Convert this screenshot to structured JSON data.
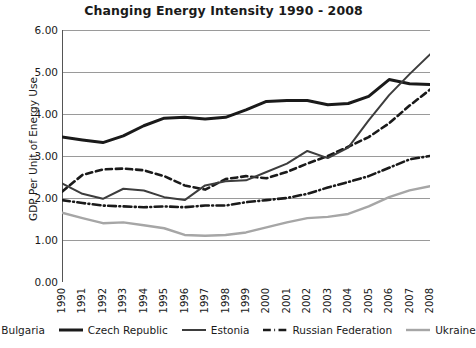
{
  "chart_data": {
    "type": "line",
    "title": "Changing Energy Intensity 1990 - 2008",
    "xlabel": "",
    "ylabel": "GDP Per Unit of Energy Use",
    "ylim": [
      0,
      6
    ],
    "ytick_labels": [
      "6.00",
      "5.00",
      "4.00",
      "3.00",
      "2.00",
      "1.00",
      "0.00"
    ],
    "ytick_values": [
      6,
      5,
      4,
      3,
      2,
      1,
      0
    ],
    "grid": true,
    "legend_position": "bottom",
    "categories": [
      "1990",
      "1991",
      "1992",
      "1993",
      "1994",
      "1995",
      "1996",
      "1997",
      "1998",
      "1999",
      "2000",
      "2001",
      "2002",
      "2003",
      "2004",
      "2005",
      "2006",
      "2007",
      "2008"
    ],
    "x": [
      1990,
      1991,
      1992,
      1993,
      1994,
      1995,
      1996,
      1997,
      1998,
      1999,
      2000,
      2001,
      2002,
      2003,
      2004,
      2005,
      2006,
      2007,
      2008
    ],
    "series": [
      {
        "name": "Bulgaria",
        "color": "#1a1a1a",
        "style": "dashed",
        "width": 2.6,
        "values": [
          2.15,
          2.55,
          2.68,
          2.7,
          2.66,
          2.52,
          2.3,
          2.2,
          2.45,
          2.52,
          2.47,
          2.62,
          2.82,
          3.0,
          3.22,
          3.45,
          3.78,
          4.2,
          4.58
        ]
      },
      {
        "name": "Czech Republic",
        "color": "#1a1a1a",
        "style": "solid",
        "width": 3.0,
        "values": [
          3.45,
          3.38,
          3.32,
          3.48,
          3.72,
          3.9,
          3.92,
          3.88,
          3.92,
          4.1,
          4.3,
          4.32,
          4.32,
          4.22,
          4.25,
          4.42,
          4.82,
          4.72,
          4.7
        ]
      },
      {
        "name": "Estonia",
        "color": "#3d3d3d",
        "style": "solid",
        "width": 2.0,
        "values": [
          2.35,
          2.1,
          1.98,
          2.22,
          2.18,
          2.02,
          1.95,
          2.3,
          2.4,
          2.42,
          2.62,
          2.82,
          3.12,
          2.95,
          3.2,
          3.85,
          4.45,
          4.95,
          5.42
        ]
      },
      {
        "name": "Russian Federation",
        "color": "#1a1a1a",
        "style": "dashdot",
        "width": 2.6,
        "values": [
          1.95,
          1.88,
          1.82,
          1.8,
          1.78,
          1.8,
          1.78,
          1.82,
          1.82,
          1.9,
          1.95,
          2.0,
          2.1,
          2.25,
          2.38,
          2.52,
          2.72,
          2.92,
          3.0
        ]
      },
      {
        "name": "Ukraine",
        "color": "#a6a6a6",
        "style": "solid",
        "width": 2.4,
        "values": [
          1.65,
          1.52,
          1.4,
          1.42,
          1.35,
          1.28,
          1.12,
          1.1,
          1.12,
          1.18,
          1.3,
          1.42,
          1.52,
          1.55,
          1.62,
          1.8,
          2.02,
          2.18,
          2.28
        ]
      }
    ]
  },
  "axis": {
    "grid_color": "#9a9a9a",
    "frame_color": "#555555"
  }
}
